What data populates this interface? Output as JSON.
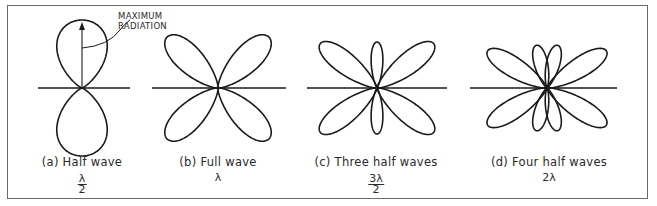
{
  "annotation": {
    "line1": "MAXIMUM",
    "line2": "RADIATION"
  },
  "patterns": [
    {
      "id": "a",
      "caption": "(a) Half wave",
      "wavelength": {
        "type": "fraction",
        "numerator": "λ",
        "denominator": "2"
      },
      "lobes_per_half": 1
    },
    {
      "id": "b",
      "caption": "(b) Full wave",
      "wavelength": {
        "type": "plain",
        "text": "λ"
      },
      "lobes_per_half": 2
    },
    {
      "id": "c",
      "caption": "(c) Three half waves",
      "wavelength": {
        "type": "fraction",
        "numerator": "3λ",
        "denominator": "2"
      },
      "lobes_per_half": 3
    },
    {
      "id": "d",
      "caption": "(d) Four half waves",
      "wavelength": {
        "type": "plain",
        "text": "2λ"
      },
      "lobes_per_half": 4
    }
  ],
  "colors": {
    "stroke": "#1a1a1a",
    "frame": "#6a6a6a"
  }
}
